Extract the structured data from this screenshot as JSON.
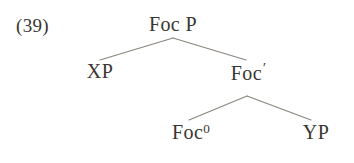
{
  "figure": {
    "example_number": "(39)",
    "background_color": "#ffffff",
    "text_color": "#3a3530",
    "line_color": "#8a857d"
  },
  "tree": {
    "root": {
      "label": "Foc P",
      "x": 173,
      "y": 25
    },
    "nodes": [
      {
        "id": "xp",
        "label": "XP",
        "base": "XP",
        "super": "",
        "x": 100,
        "y": 72
      },
      {
        "id": "focbar",
        "label": "Foc′",
        "base": "Foc",
        "super": "′",
        "x": 248,
        "y": 72
      },
      {
        "id": "fochead",
        "label": "Foc0",
        "base": "Foc",
        "super": "0",
        "x": 191,
        "y": 133
      },
      {
        "id": "yp",
        "label": "YP",
        "base": "YP",
        "super": "",
        "x": 316,
        "y": 133
      }
    ],
    "branches": [
      {
        "from": "root",
        "to": "xp",
        "x1": 173,
        "y1": 38,
        "x2": 100,
        "y2": 60
      },
      {
        "from": "root",
        "to": "focbar",
        "x1": 173,
        "y1": 38,
        "x2": 246,
        "y2": 60
      },
      {
        "from": "focbar",
        "to": "fochead",
        "x1": 247,
        "y1": 96,
        "x2": 189,
        "y2": 120
      },
      {
        "from": "focbar",
        "to": "yp",
        "x1": 247,
        "y1": 96,
        "x2": 311,
        "y2": 120
      }
    ]
  }
}
